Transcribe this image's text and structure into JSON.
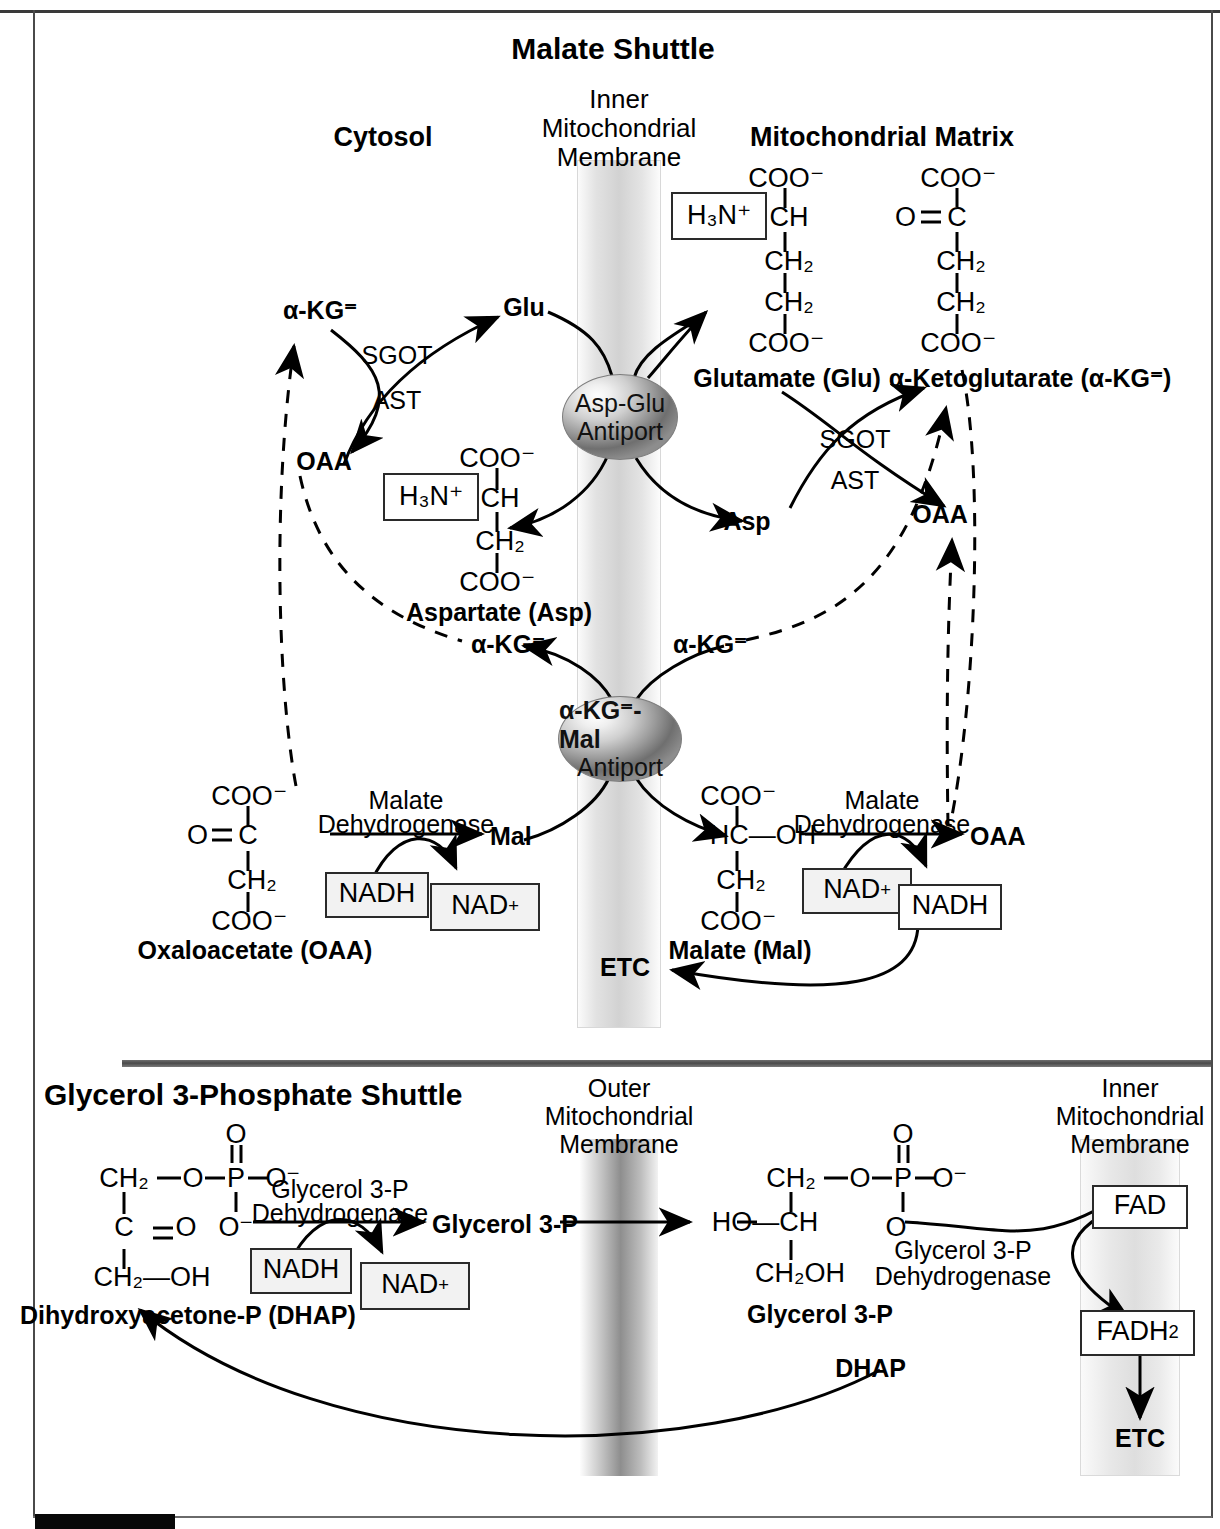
{
  "figure": {
    "panels": [
      {
        "id": "malate-shuttle",
        "title": "Malate Shuttle",
        "compartments": {
          "left": "Cytosol",
          "membrane": [
            "Inner",
            "Mitochondrial",
            "Membrane"
          ],
          "right": "Mitochondrial Matrix"
        },
        "transporters": [
          {
            "name": "Asp-Glu Antiport",
            "line1": "Asp-Glu",
            "line2": "Antiport"
          },
          {
            "name": "aKG-Mal Antiport",
            "line1": "α-KG⁼-Mal",
            "line2": "Antiport"
          }
        ],
        "enzymes": [
          {
            "name": "SGOT/AST cytosolic",
            "line1": "SGOT",
            "line2": "AST"
          },
          {
            "name": "SGOT/AST mitochondrial",
            "line1": "SGOT",
            "line2": "AST"
          },
          {
            "name": "Malate Dehydrogenase cytosolic",
            "line1": "Malate",
            "line2": "Dehydrogenase"
          },
          {
            "name": "Malate Dehydrogenase mitochondrial",
            "line1": "Malate",
            "line2": "Dehydrogenase"
          }
        ],
        "metabolite_labels": {
          "akg_cytosol": "α-KG⁼",
          "glu_cytosol": "Glu",
          "oaa_cytosol": "OAA",
          "aspartate_name": "Aspartate (Asp)",
          "glutamate_name": "Glutamate (Glu)",
          "ketoglutarate_name": "α-Ketoglutarate (α-KG⁼)",
          "asp_matrix": "Asp",
          "oaa_matrix": "OAA",
          "akg_cytosol_mid": "α-KG⁼",
          "akg_matrix_mid": "α-KG⁼",
          "oxaloacetate_name": "Oxaloacetate (OAA)",
          "malate_name": "Malate (Mal)",
          "mal_cytosol": "Mal",
          "oaa_matrix_lower": "OAA",
          "etc": "ETC"
        },
        "cofactors": [
          {
            "name": "cytosolic-nadh",
            "label": "NADH"
          },
          {
            "name": "cytosolic-nad-plus",
            "label": "NAD",
            "charge": "+"
          },
          {
            "name": "matrix-nad-plus",
            "label": "NAD",
            "charge": "+"
          },
          {
            "name": "matrix-nadh",
            "label": "NADH"
          }
        ],
        "structures": {
          "aspartate": {
            "amine": "H₃N⁺",
            "atoms": [
              "COO⁻",
              "CH",
              "CH₂",
              "COO⁻"
            ]
          },
          "glutamate": {
            "amine": "H₃N⁺",
            "atoms": [
              "COO⁻",
              "CH",
              "CH₂",
              "CH₂",
              "COO⁻"
            ]
          },
          "ketoglutarate": {
            "keto": "O",
            "atoms": [
              "COO⁻",
              "C",
              "CH₂",
              "CH₂",
              "COO⁻"
            ]
          },
          "oxaloacetate": {
            "keto": "O",
            "atoms": [
              "COO⁻",
              "C",
              "CH₂",
              "COO⁻"
            ]
          },
          "malate": {
            "atoms": [
              "COO⁻",
              "HC—OH",
              "CH₂",
              "COO⁻"
            ]
          }
        }
      },
      {
        "id": "glycerol-3-phosphate-shuttle",
        "title": "Glycerol 3-Phosphate Shuttle",
        "compartments": {
          "outer_membrane": [
            "Outer",
            "Mitochondrial",
            "Membrane"
          ],
          "inner_membrane": [
            "Inner",
            "Mitochondrial",
            "Membrane"
          ]
        },
        "enzymes": [
          {
            "name": "Glycerol 3-P Dehydrogenase cytosolic",
            "line1": "Glycerol 3-P",
            "line2": "Dehydrogenase"
          },
          {
            "name": "Glycerol 3-P Dehydrogenase membrane",
            "line1": "Glycerol 3-P",
            "line2": "Dehydrogenase"
          }
        ],
        "metabolite_labels": {
          "dhap_name": "Dihydroxyacetone-P (DHAP)",
          "glycerol3p_product": "Glycerol 3-P",
          "glycerol3p_name": "Glycerol 3-P",
          "dhap_return": "DHAP",
          "etc": "ETC"
        },
        "cofactors": [
          {
            "name": "nadh",
            "label": "NADH"
          },
          {
            "name": "nad-plus",
            "label": "NAD",
            "charge": "+"
          },
          {
            "name": "fad",
            "label": "FAD"
          },
          {
            "name": "fadh2",
            "label": "FADH",
            "subscript": "2"
          }
        ],
        "structures": {
          "dhap": {
            "phosphate_O": "O",
            "P": "P",
            "O_minus_right": "O⁻",
            "O_minus_below": "O⁻",
            "c1": "CH₂",
            "c1_link": "O",
            "c2": "C",
            "c2_keto": "O",
            "c3": "CH₂—OH"
          },
          "glycerol3p": {
            "phosphate_O": "O",
            "P": "P",
            "O_minus_right": "O⁻",
            "O_minus_below": "O⁻",
            "c1": "CH₂",
            "c1_link": "O",
            "c2": "HO—CH",
            "c3": "CH₂OH"
          }
        }
      }
    ]
  },
  "colors": {
    "ink": "#000000",
    "membrane_light": "#e2e2e2",
    "membrane_dark": "#8e8e8e",
    "divider": "#4a4a4a",
    "box_fill": "#f2f2f2"
  }
}
